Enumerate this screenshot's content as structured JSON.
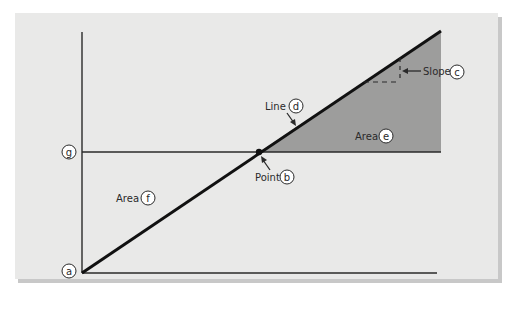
{
  "diagram": {
    "colors": {
      "panel": "#e9e9e8",
      "panel_shadow": "#9a9a9a",
      "shaded_area": "#9d9d9c",
      "line": "#111111",
      "axis": "#2a2a2a"
    },
    "labels": {
      "point_a": "a",
      "point_b_text": "Point",
      "point_b": "b",
      "slope_text": "Slope",
      "slope_marker": "c",
      "line_text": "Line",
      "line_marker": "d",
      "area_e_text": "Area",
      "area_e_marker": "e",
      "area_f_text": "Area",
      "area_f_marker": "f",
      "level_g": "g"
    }
  }
}
